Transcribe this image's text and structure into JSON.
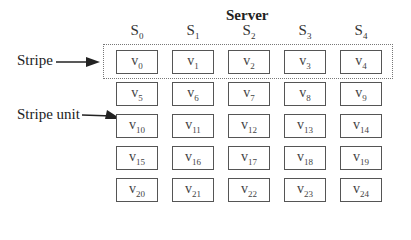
{
  "diagram": {
    "title": "Server",
    "servers": [
      {
        "letter": "S",
        "sub": "0"
      },
      {
        "letter": "S",
        "sub": "1"
      },
      {
        "letter": "S",
        "sub": "2"
      },
      {
        "letter": "S",
        "sub": "3"
      },
      {
        "letter": "S",
        "sub": "4"
      }
    ],
    "annotations": {
      "stripe": "Stripe",
      "stripe_unit": "Stripe unit"
    },
    "grid": [
      [
        {
          "v": "v",
          "sub": "0"
        },
        {
          "v": "v",
          "sub": "1"
        },
        {
          "v": "v",
          "sub": "2"
        },
        {
          "v": "v",
          "sub": "3"
        },
        {
          "v": "v",
          "sub": "4"
        }
      ],
      [
        {
          "v": "v",
          "sub": "5"
        },
        {
          "v": "v",
          "sub": "6"
        },
        {
          "v": "v",
          "sub": "7"
        },
        {
          "v": "v",
          "sub": "8"
        },
        {
          "v": "v",
          "sub": "9"
        }
      ],
      [
        {
          "v": "v",
          "sub": "10"
        },
        {
          "v": "v",
          "sub": "11"
        },
        {
          "v": "v",
          "sub": "12"
        },
        {
          "v": "v",
          "sub": "13"
        },
        {
          "v": "v",
          "sub": "14"
        }
      ],
      [
        {
          "v": "v",
          "sub": "15"
        },
        {
          "v": "v",
          "sub": "16"
        },
        {
          "v": "v",
          "sub": "17"
        },
        {
          "v": "v",
          "sub": "18"
        },
        {
          "v": "v",
          "sub": "19"
        }
      ],
      [
        {
          "v": "v",
          "sub": "20"
        },
        {
          "v": "v",
          "sub": "21"
        },
        {
          "v": "v",
          "sub": "22"
        },
        {
          "v": "v",
          "sub": "23"
        },
        {
          "v": "v",
          "sub": "24"
        }
      ]
    ],
    "highlighted_stripe_row": 0,
    "highlighted_unit": "v10"
  }
}
